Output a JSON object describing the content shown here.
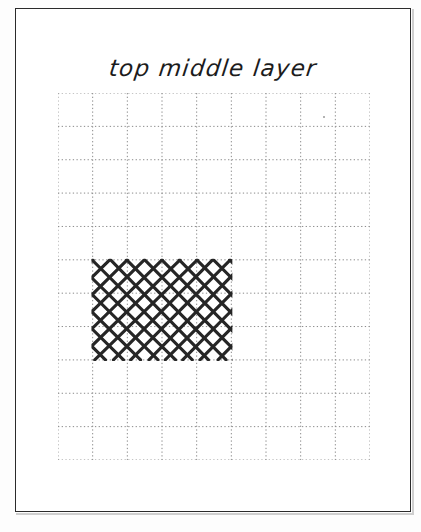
{
  "page": {
    "title": "top middle layer",
    "background_color": "#ffffff",
    "border_color": "#2b2b2b"
  },
  "grid": {
    "columns": 9,
    "rows": 11,
    "cell_width": 34.7,
    "cell_height": 33.4,
    "origin_x": 58,
    "origin_y": 93,
    "line_color": "#8a8a8a",
    "line_style": "dotted"
  },
  "hatch_region": {
    "label": "cross-hatched lattice",
    "pattern": "diagonal-lattice",
    "start_column": 1,
    "end_column": 5,
    "start_row": 5,
    "end_row": 8,
    "columns_spanned": 4,
    "rows_spanned": 3,
    "diagonal_spacing": 17.35,
    "stroke_color": "#262626",
    "stroke_width": 3.1
  },
  "artifacts": [
    {
      "name": "scan-speck",
      "x": 265,
      "y": 23
    }
  ]
}
